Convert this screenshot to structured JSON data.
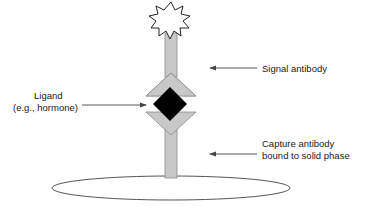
{
  "diagram": {
    "type": "sandwich immunoassay schematic",
    "labels": {
      "signal": "Signal antibody",
      "ligand_line1": "Ligand",
      "ligand_line2": "(e.g., hormone)",
      "capture_line1": "Capture antibody",
      "capture_line2": "bound to solid phase"
    },
    "components": [
      {
        "name": "signal-label-star",
        "shape": "starburst"
      },
      {
        "name": "signal-antibody",
        "shape": "stalk with upward chevron"
      },
      {
        "name": "ligand",
        "shape": "black diamond"
      },
      {
        "name": "capture-antibody",
        "shape": "stalk with downward chevron"
      },
      {
        "name": "solid-phase",
        "shape": "ellipse"
      }
    ],
    "colors": {
      "antibody_fill": "#c8c8c8",
      "antibody_stroke": "#8a8a8a",
      "ligand_fill": "#000000",
      "arrow": "#444444",
      "outline": "#555555"
    }
  }
}
